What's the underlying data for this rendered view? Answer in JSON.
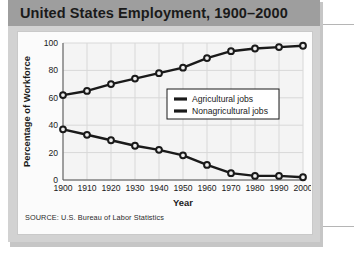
{
  "card": {
    "title": "United States Employment, 1900–2000",
    "source": "SOURCE: U.S. Bureau of Labor Statistics"
  },
  "colors": {
    "title_band": "#9e9e9e",
    "card": "#d2d2d2",
    "panel": "#fbfbfb",
    "series": "#1a1a1a",
    "grid": "#d8d8d8",
    "axis": "#555555"
  },
  "chart_data": {
    "type": "line",
    "title": "United States Employment, 1900–2000",
    "xlabel": "Year",
    "ylabel": "Percentage of Workforce",
    "x": [
      1900,
      1910,
      1920,
      1930,
      1940,
      1950,
      1960,
      1970,
      1980,
      1990,
      2000
    ],
    "categories": [
      "1900",
      "1910",
      "1920",
      "1930",
      "1940",
      "1950",
      "1960",
      "1970",
      "1980",
      "1990",
      "2000"
    ],
    "series": [
      {
        "name": "Nonagricultural jobs",
        "values": [
          62,
          65,
          70,
          74,
          78,
          82,
          89,
          94,
          96,
          97,
          98
        ]
      },
      {
        "name": "Agricultural jobs",
        "values": [
          37,
          33,
          29,
          25,
          22,
          18,
          11,
          5,
          3,
          3,
          2
        ]
      }
    ],
    "xlim": [
      1900,
      2000
    ],
    "ylim": [
      0,
      100
    ],
    "yticks": [
      0,
      20,
      40,
      60,
      80,
      100
    ],
    "ytick_labels": [
      "0",
      "20",
      "40",
      "60",
      "80",
      "100"
    ],
    "grid": true,
    "legend_position": "center-right",
    "legend": [
      "Agricultural jobs",
      "Nonagricultural jobs"
    ],
    "source": "SOURCE: U.S. Bureau of Labor Statistics"
  }
}
